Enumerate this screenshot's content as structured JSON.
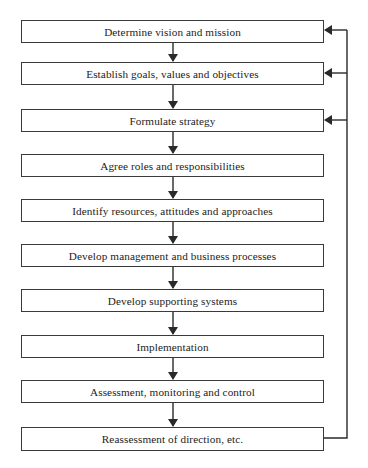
{
  "diagram": {
    "type": "flowchart",
    "steps": [
      {
        "label": "Determine vision and mission",
        "top": 20,
        "feedback_in": true
      },
      {
        "label": "Establish goals, values and objectives",
        "top": 62,
        "feedback_in": true
      },
      {
        "label": "Formulate strategy",
        "top": 109,
        "feedback_in": true
      },
      {
        "label": "Agree roles and responsibilities",
        "top": 154,
        "feedback_in": false
      },
      {
        "label": "Identify resources, attitudes and approaches",
        "top": 199,
        "feedback_in": false
      },
      {
        "label": "Develop management and business processes",
        "top": 244,
        "feedback_in": false
      },
      {
        "label": "Develop supporting systems",
        "top": 289,
        "feedback_in": false
      },
      {
        "label": "Implementation",
        "top": 335,
        "feedback_in": false
      },
      {
        "label": "Assessment, monitoring and control",
        "top": 380,
        "feedback_in": false
      },
      {
        "label": "Reassessment of direction, etc.",
        "top": 427,
        "feedback_in": false
      }
    ],
    "feedback_loop": {
      "from": "Reassessment of direction, etc.",
      "to": [
        "Determine vision and mission",
        "Establish goals, values and objectives",
        "Formulate strategy"
      ]
    },
    "colors": {
      "line": "#2a2a2a",
      "box_border": "#3a3a3a",
      "background": "#ffffff",
      "text": "#222222"
    }
  }
}
